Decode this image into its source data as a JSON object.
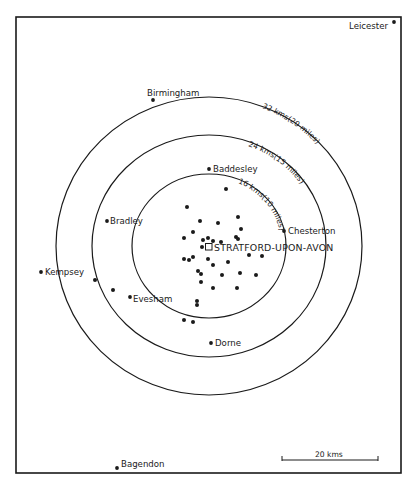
{
  "map": {
    "center": {
      "name": "STRATFORD-UPON-AVON",
      "x": 209,
      "y": 247,
      "marker": "open-square"
    },
    "rings": [
      {
        "id": "inner",
        "label": "16 kms(10 miles)",
        "cx": 209,
        "cy": 246,
        "rx": 77,
        "ry": 72
      },
      {
        "id": "middle",
        "label": "24 kms(15 miles)",
        "cx": 209,
        "cy": 246,
        "rx": 117,
        "ry": 111
      },
      {
        "id": "outer",
        "label": "32 kms(20 miles)",
        "cx": 209,
        "cy": 246,
        "rx": 153,
        "ry": 149
      }
    ],
    "places": [
      {
        "name": "Leicester",
        "x": 394,
        "y": 22,
        "label_x": 349,
        "label_y": 29,
        "anchor": "start"
      },
      {
        "name": "Birmingham",
        "x": 153,
        "y": 100,
        "label_x": 147,
        "label_y": 96,
        "anchor": "start"
      },
      {
        "name": "Baddesley",
        "x": 209,
        "y": 169,
        "label_x": 213,
        "label_y": 172,
        "anchor": "start"
      },
      {
        "name": "Bradley",
        "x": 107,
        "y": 221,
        "label_x": 110,
        "label_y": 224,
        "anchor": "start"
      },
      {
        "name": "Chesterton",
        "x": 284,
        "y": 231,
        "label_x": 288,
        "label_y": 234,
        "anchor": "start"
      },
      {
        "name": "Kempsey",
        "x": 41,
        "y": 272,
        "label_x": 45,
        "label_y": 275,
        "anchor": "start"
      },
      {
        "name": "Evesham",
        "x": 130,
        "y": 297,
        "label_x": 133,
        "label_y": 302,
        "anchor": "start"
      },
      {
        "name": "Dorne",
        "x": 211,
        "y": 343,
        "label_x": 215,
        "label_y": 346,
        "anchor": "start"
      },
      {
        "name": "Bagendon",
        "x": 117,
        "y": 468,
        "label_x": 121,
        "label_y": 467,
        "anchor": "start"
      }
    ],
    "sites": [
      [
        187,
        207
      ],
      [
        200,
        221
      ],
      [
        218,
        223
      ],
      [
        193,
        232
      ],
      [
        184,
        238
      ],
      [
        203,
        240
      ],
      [
        208,
        238
      ],
      [
        213,
        241
      ],
      [
        221,
        242
      ],
      [
        202,
        247
      ],
      [
        238,
        217
      ],
      [
        241,
        229
      ],
      [
        236,
        237
      ],
      [
        238,
        239
      ],
      [
        226,
        189
      ],
      [
        184,
        259
      ],
      [
        189,
        260
      ],
      [
        193,
        257
      ],
      [
        208,
        259
      ],
      [
        213,
        265
      ],
      [
        228,
        262
      ],
      [
        249,
        255
      ],
      [
        262,
        256
      ],
      [
        198,
        271
      ],
      [
        201,
        274
      ],
      [
        222,
        275
      ],
      [
        240,
        273
      ],
      [
        256,
        275
      ],
      [
        201,
        282
      ],
      [
        213,
        288
      ],
      [
        237,
        288
      ],
      [
        197,
        301
      ],
      [
        184,
        320
      ],
      [
        193,
        322
      ],
      [
        95,
        280
      ],
      [
        113,
        290
      ],
      [
        197,
        305
      ]
    ],
    "scale_bar": {
      "label": "20 kms",
      "x1": 282,
      "x2": 378,
      "y": 460
    },
    "frame": {
      "x": 16,
      "y": 17,
      "width": 385,
      "height": 456
    },
    "colors": {
      "ink": "#1a1a1a",
      "paper": "#ffffff"
    }
  }
}
